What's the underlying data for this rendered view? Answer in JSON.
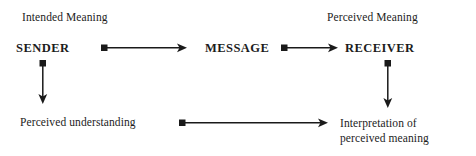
{
  "diagram": {
    "width": 476,
    "height": 156,
    "background_color": "#ffffff",
    "stroke_color": "#1a1a1a"
  },
  "captions": {
    "intended": "Intended Meaning",
    "perceived": "Perceived Meaning"
  },
  "entities": {
    "sender": "SENDER",
    "message": "MESSAGE",
    "receiver": "RECEIVER"
  },
  "outcomes": {
    "perceived_understanding": "Perceived understanding",
    "interpretation_line1": "Interpretation of",
    "interpretation_line2": "perceived meaning"
  },
  "connectors": [
    {
      "id": "sender-to-message",
      "label": "",
      "from": "SENDER",
      "to": "MESSAGE",
      "orientation": "horizontal",
      "tail_marker": "square",
      "head_marker": "arrow"
    },
    {
      "id": "message-to-receiver",
      "label": "",
      "from": "MESSAGE",
      "to": "RECEIVER",
      "orientation": "horizontal",
      "tail_marker": "square",
      "head_marker": "arrow"
    },
    {
      "id": "sender-to-perceived-understanding",
      "label": "",
      "from": "SENDER",
      "to": "Perceived understanding",
      "orientation": "vertical",
      "tail_marker": "square",
      "head_marker": "arrow"
    },
    {
      "id": "receiver-to-interpretation",
      "label": "",
      "from": "RECEIVER",
      "to": "Interpretation of perceived meaning",
      "orientation": "vertical",
      "tail_marker": "square",
      "head_marker": "arrow"
    },
    {
      "id": "perceived-understanding-to-interpretation",
      "label": "",
      "from": "Perceived understanding",
      "to": "Interpretation of perceived meaning",
      "orientation": "horizontal",
      "tail_marker": "square",
      "head_marker": "arrow"
    }
  ]
}
